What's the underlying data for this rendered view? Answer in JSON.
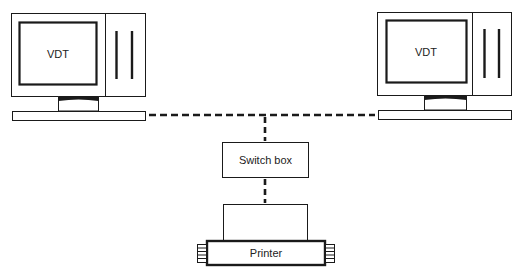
{
  "diagram": {
    "type": "network-topology",
    "nodes": [
      {
        "id": "vdt-left",
        "label": "VDT",
        "kind": "terminal"
      },
      {
        "id": "vdt-right",
        "label": "VDT",
        "kind": "terminal"
      },
      {
        "id": "switch",
        "label": "Switch box",
        "kind": "switch"
      },
      {
        "id": "printer",
        "label": "Printer",
        "kind": "printer"
      }
    ],
    "edges": [
      {
        "from": "vdt-left",
        "to": "switch",
        "style": "dashed"
      },
      {
        "from": "vdt-right",
        "to": "switch",
        "style": "dashed"
      },
      {
        "from": "switch",
        "to": "printer",
        "style": "dashed"
      }
    ]
  },
  "labels": {
    "vdt_left": "VDT",
    "vdt_right": "VDT",
    "switch_box": "Switch box",
    "printer": "Printer"
  },
  "colors": {
    "stroke": "#1a1a1a",
    "background": "#ffffff"
  }
}
